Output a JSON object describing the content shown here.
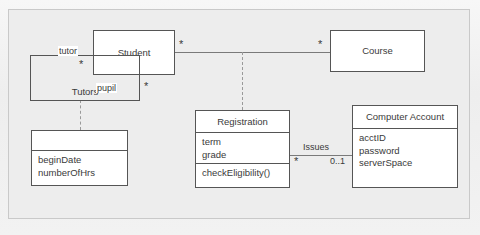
{
  "diagram": {
    "type": "uml-class-diagram",
    "background_color": "#ededed",
    "box_fill": "#ffffff",
    "line_color": "#555555"
  },
  "classes": {
    "student": {
      "name": "Student",
      "attributes": [],
      "operations": []
    },
    "course": {
      "name": "Course",
      "attributes": [],
      "operations": []
    },
    "tutors": {
      "name": "Tutors",
      "attributes": [],
      "operations": []
    },
    "tutors_details": {
      "name": "",
      "attributes": [
        "beginDate",
        "numberOfHrs"
      ],
      "operations": []
    },
    "registration": {
      "name": "Registration",
      "attributes": [
        "term",
        "grade"
      ],
      "operations": [
        "checkEligibility()"
      ]
    },
    "computer_account": {
      "name": "Computer Account",
      "attributes": [
        "acctID",
        "password",
        "serverSpace"
      ],
      "operations": []
    }
  },
  "associations": {
    "student_course": {
      "name": "",
      "source_multiplicity": "*",
      "target_multiplicity": "*"
    },
    "student_tutors": {
      "name": "Tutors",
      "role_a": "tutor",
      "role_a_multiplicity": "*",
      "role_b": "pupil",
      "role_b_multiplicity": "*"
    },
    "registration_account": {
      "name": "Issues",
      "source_multiplicity": "*",
      "target_multiplicity": "0..1"
    }
  }
}
